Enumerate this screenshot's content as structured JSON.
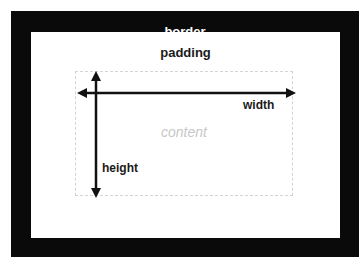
{
  "diagram": {
    "layers": {
      "border": {
        "label": "border",
        "color": "#0a0a0a",
        "label_color": "#ffffff"
      },
      "padding": {
        "label": "padding",
        "color": "#ffffff",
        "label_color": "#1a1a1a"
      },
      "content": {
        "label": "content",
        "label_color": "#c8c8c8",
        "outline": "dashed",
        "outline_color": "#d4d4d4"
      }
    },
    "dimensions": {
      "width": {
        "label": "width",
        "direction": "horizontal",
        "arrowheads": "both"
      },
      "height": {
        "label": "height",
        "direction": "vertical",
        "arrowheads": "both"
      }
    },
    "arrow_color": "#111111"
  }
}
